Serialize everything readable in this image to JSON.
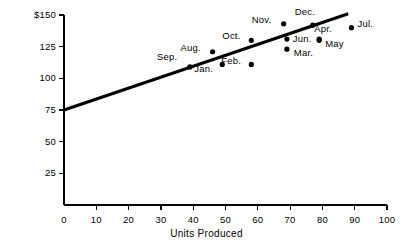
{
  "chart_data": {
    "type": "scatter",
    "title": "",
    "xlabel": "Units Produced",
    "ylabel": "Total Cost of Production",
    "xlim": [
      0,
      100
    ],
    "ylim": [
      0,
      150
    ],
    "grid": false,
    "legend": "none",
    "x_ticks": [
      "0",
      "10",
      "20",
      "30",
      "40",
      "50",
      "60",
      "70",
      "80",
      "90",
      "100"
    ],
    "x_tick_values": [
      0,
      10,
      20,
      30,
      40,
      50,
      60,
      70,
      80,
      90,
      100
    ],
    "y_ticks": [
      "25",
      "50",
      "75",
      "100",
      "125",
      "$150"
    ],
    "y_tick_values": [
      25,
      50,
      75,
      100,
      125,
      150
    ],
    "point_color": "#000000",
    "line_color": "#000000",
    "axis_color": "#000000",
    "points": [
      {
        "label": "Sep.",
        "x": 39,
        "y": 109,
        "lx": -33,
        "ly": -11
      },
      {
        "label": "Aug.",
        "x": 46,
        "y": 121,
        "lx": -32,
        "ly": -5
      },
      {
        "label": "Jan.",
        "x": 49,
        "y": 111,
        "lx": -28,
        "ly": 4
      },
      {
        "label": "Feb.",
        "x": 58,
        "y": 111,
        "lx": -30,
        "ly": -4
      },
      {
        "label": "Oct.",
        "x": 58,
        "y": 130,
        "lx": -29,
        "ly": -5
      },
      {
        "label": "Nov.",
        "x": 68,
        "y": 143,
        "lx": -32,
        "ly": -5
      },
      {
        "label": "Jun.",
        "x": 69,
        "y": 131,
        "lx": 6,
        "ly": -1
      },
      {
        "label": "Mar.",
        "x": 69,
        "y": 123,
        "lx": 7,
        "ly": 3
      },
      {
        "label": "Dec.",
        "x": 77,
        "y": 142,
        "lx": -18,
        "ly": -14
      },
      {
        "label": "Apr.",
        "x": 79,
        "y": 131,
        "lx": -5,
        "ly": -11
      },
      {
        "label": "May",
        "x": 79,
        "y": 130,
        "lx": 6,
        "ly": 3
      },
      {
        "label": "Jul.",
        "x": 89,
        "y": 140,
        "lx": 6,
        "ly": -5
      }
    ],
    "trendline": {
      "name": "regression-line",
      "x0": 0,
      "y0": 75,
      "x1": 88,
      "y1": 151
    }
  }
}
